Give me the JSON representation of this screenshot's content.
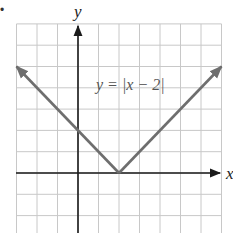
{
  "chart_data": {
    "type": "line",
    "title": "",
    "xlabel": "x",
    "ylabel": "y",
    "annotation": "y = |x − 2|",
    "grid": true,
    "xlim": [
      -3,
      7
    ],
    "ylim": [
      -3,
      7
    ],
    "series": [
      {
        "name": "y = |x − 2|",
        "x": [
          -3,
          2,
          7
        ],
        "y": [
          5,
          0,
          5
        ],
        "color": "#6e6e6e",
        "arrows": "both-ends"
      }
    ],
    "key_points": {
      "vertex": [
        2,
        0
      ],
      "y_intercept": [
        0,
        2
      ]
    }
  },
  "labels": {
    "x_axis": "x",
    "y_axis": "y",
    "equation": "y = |x − 2|",
    "bullet": "•"
  },
  "colors": {
    "grid": "#c8c8c8",
    "axis": "#1a1a1a",
    "curve": "#6e6e6e",
    "text": "#555555"
  }
}
